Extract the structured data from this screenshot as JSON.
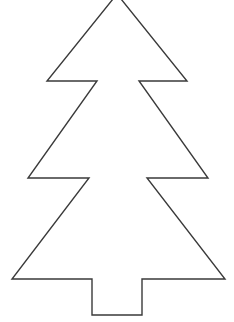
{
  "image": {
    "title": "Christmas tree outline coloring template",
    "subject": "christmas-tree",
    "style": "line-art outline",
    "background_color": "#ffffff",
    "stroke_color": "#3a3a3a",
    "stroke_width_px": 1.4,
    "fill_color": "#ffffff",
    "width_px": 234,
    "height_px": 322,
    "text_content": "",
    "watermark": ""
  },
  "shape": {
    "name": "christmas-tree-outline",
    "description": "Three-tier coniferous tree silhouette with rectangular trunk, apex clipped at the top image edge",
    "tiers": 3,
    "trunk": {
      "left_x": 92,
      "right_x": 142,
      "top_y": 279,
      "bottom_y": 315
    },
    "apex": {
      "x": 117,
      "y": -6
    },
    "tier_tips": [
      {
        "tier": 1,
        "left_x": 47,
        "right_x": 187,
        "y": 81
      },
      {
        "tier": 2,
        "left_x": 28,
        "right_x": 208,
        "y": 178
      },
      {
        "tier": 3,
        "left_x": 12,
        "right_x": 225,
        "y": 279
      }
    ],
    "notches": [
      {
        "tier": 1,
        "left_x": 97,
        "right_x": 139,
        "y": 81
      },
      {
        "tier": 2,
        "left_x": 89,
        "right_x": 147,
        "y": 178
      }
    ],
    "points": "117,-6 47,81 97,81 28,178 89,178 12,279 92,279 92,315 142,315 142,279 225,279 147,178 208,178 139,81 187,81"
  }
}
